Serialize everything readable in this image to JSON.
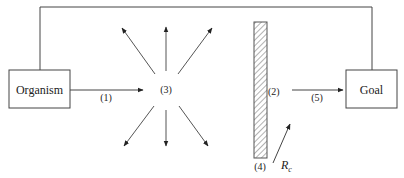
{
  "diagram": {
    "nodes": {
      "organism": {
        "label": "Organism"
      },
      "goal": {
        "label": "Goal"
      }
    },
    "labels": {
      "path_1": "(1)",
      "center_3": "(3)",
      "barrier_2": "(2)",
      "path_5": "(5)",
      "barrier_4": "(4)",
      "response_symbol": "R",
      "response_subscript": "c"
    },
    "connections": [
      {
        "from": "organism",
        "to": "center_3",
        "label": "(1)"
      },
      {
        "from": "center_3",
        "to": "up",
        "type": "divergent"
      },
      {
        "from": "center_3",
        "to": "up-left",
        "type": "divergent"
      },
      {
        "from": "center_3",
        "to": "up-right",
        "type": "divergent"
      },
      {
        "from": "center_3",
        "to": "down",
        "type": "divergent"
      },
      {
        "from": "center_3",
        "to": "down-left",
        "type": "divergent"
      },
      {
        "from": "center_3",
        "to": "down-right",
        "type": "divergent"
      },
      {
        "from": "barrier_2",
        "to": "goal",
        "label": "(5)"
      },
      {
        "from": "organism",
        "to": "goal",
        "type": "top-link"
      }
    ],
    "colors": {
      "line": "#333333",
      "box_border": "#444444",
      "hatch": "#555555"
    }
  }
}
